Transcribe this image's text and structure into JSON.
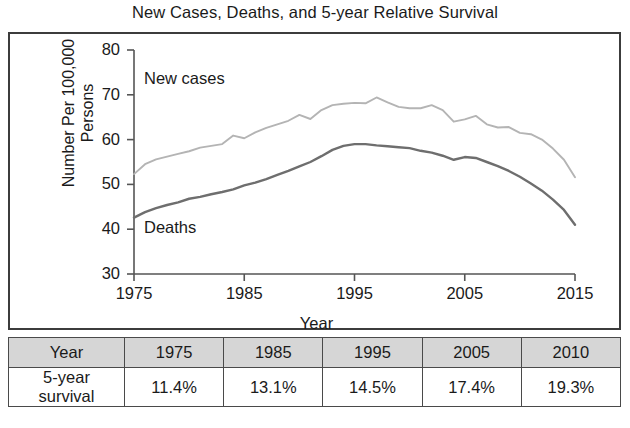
{
  "title": "New Cases, Deaths, and 5-year Relative Survival",
  "chart_data": {
    "type": "line",
    "title": "New Cases, Deaths, and 5-year Relative Survival",
    "xlabel": "Year",
    "ylabel": "Number Per 100,000 Persons",
    "xlim": [
      1975,
      2015
    ],
    "ylim": [
      30,
      80
    ],
    "xticks": [
      "1975",
      "1985",
      "1995",
      "2005",
      "2015"
    ],
    "yticks": [
      "30",
      "40",
      "50",
      "60",
      "70",
      "80"
    ],
    "grid": false,
    "legend": "inline-labels",
    "x": [
      1975,
      1976,
      1977,
      1978,
      1979,
      1980,
      1981,
      1982,
      1983,
      1984,
      1985,
      1986,
      1987,
      1988,
      1989,
      1990,
      1991,
      1992,
      1993,
      1994,
      1995,
      1996,
      1997,
      1998,
      1999,
      2000,
      2001,
      2002,
      2003,
      2004,
      2005,
      2006,
      2007,
      2008,
      2009,
      2010,
      2011,
      2012,
      2013,
      2014,
      2015
    ],
    "series": [
      {
        "name": "New cases",
        "color": "#b4b4b4",
        "label_position": "upper-left",
        "values": [
          52.3,
          54.5,
          55.6,
          56.2,
          56.8,
          57.4,
          58.2,
          58.6,
          59.0,
          60.9,
          60.3,
          61.6,
          62.6,
          63.4,
          64.2,
          65.5,
          64.6,
          66.6,
          67.7,
          68.0,
          68.2,
          68.1,
          69.4,
          68.3,
          67.3,
          67.0,
          67.0,
          67.7,
          66.6,
          64.0,
          64.5,
          65.3,
          63.4,
          62.7,
          62.8,
          61.5,
          61.2,
          60.0,
          58.0,
          55.5,
          51.6
        ]
      },
      {
        "name": "Deaths",
        "color": "#6e6e6e",
        "label_position": "lower-left",
        "values": [
          42.6,
          43.8,
          44.7,
          45.4,
          46.0,
          46.8,
          47.2,
          47.8,
          48.3,
          48.9,
          49.8,
          50.4,
          51.2,
          52.1,
          53.0,
          54.0,
          55.0,
          56.3,
          57.7,
          58.6,
          59.0,
          59.0,
          58.7,
          58.5,
          58.3,
          58.1,
          57.5,
          57.1,
          56.4,
          55.5,
          56.1,
          55.9,
          55.0,
          54.1,
          53.0,
          51.7,
          50.2,
          48.6,
          46.6,
          44.3,
          41.0
        ]
      }
    ]
  },
  "table": {
    "header": [
      "Year",
      "1975",
      "1985",
      "1995",
      "2005",
      "2010"
    ],
    "row_label_line1": "5-year",
    "row_label_line2": "survival",
    "values": [
      "11.4%",
      "13.1%",
      "14.5%",
      "17.4%",
      "19.3%"
    ]
  }
}
